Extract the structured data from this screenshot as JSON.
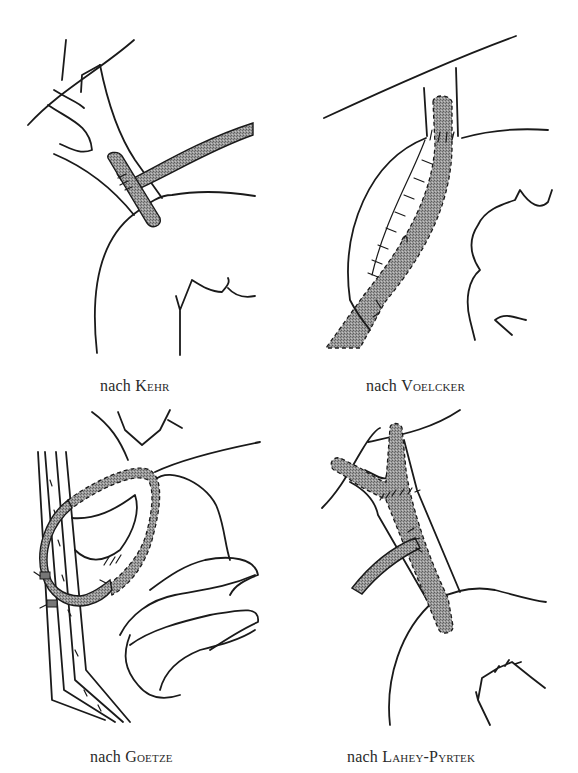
{
  "figure": {
    "panels": [
      {
        "id": "kehr",
        "caption_prefix": "nach ",
        "caption_name": "Kehr"
      },
      {
        "id": "voelcker",
        "caption_prefix": "nach ",
        "caption_name": "Voelcker"
      },
      {
        "id": "goetze",
        "caption_prefix": "nach ",
        "caption_name": "Goetze"
      },
      {
        "id": "lahey-pyrtek",
        "caption_prefix": "nach ",
        "caption_name": "Lahey-Pyrtek"
      }
    ],
    "colors": {
      "line": "#1a1a1a",
      "tube_fill": "#8c8c8c",
      "background": "#ffffff"
    }
  }
}
